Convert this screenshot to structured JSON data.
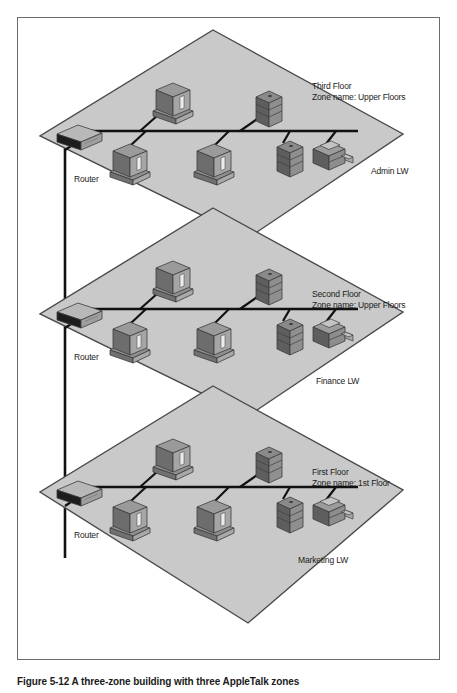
{
  "figure": {
    "caption": "Figure 5-12  A three-zone  building with three AppleTalk zones",
    "colors": {
      "floor_fill": "#c9c9c9",
      "floor_edge": "#4a4a4a",
      "cable": "#111111",
      "device_light": "#b3b3b3",
      "device_mid": "#8c8c8c",
      "device_dark": "#5a5a5a",
      "border": "#6b6b6b",
      "text": "#1a1a1a",
      "background": "#ffffff"
    }
  },
  "floors": [
    {
      "id": "third-floor",
      "title": "Third Floor",
      "zone": "Zone name: Upper Floors",
      "router_label": "Router",
      "printer_label": "Admin LW",
      "devices": [
        {
          "type": "computer",
          "name": "computer-upper"
        },
        {
          "type": "server",
          "name": "server-upper"
        },
        {
          "type": "computer",
          "name": "computer-lower-left"
        },
        {
          "type": "computer",
          "name": "computer-lower-center"
        },
        {
          "type": "server",
          "name": "server-lower"
        },
        {
          "type": "printer",
          "name": "printer"
        }
      ]
    },
    {
      "id": "second-floor",
      "title": "Second Floor",
      "zone": "Zone name: Upper Floors",
      "router_label": "Router",
      "printer_label": "Finance LW",
      "devices": [
        {
          "type": "computer",
          "name": "computer-upper"
        },
        {
          "type": "server",
          "name": "server-upper"
        },
        {
          "type": "computer",
          "name": "computer-lower-left"
        },
        {
          "type": "computer",
          "name": "computer-lower-center"
        },
        {
          "type": "server",
          "name": "server-lower"
        },
        {
          "type": "printer",
          "name": "printer"
        }
      ]
    },
    {
      "id": "first-floor",
      "title": "First Floor",
      "zone": "Zone name: 1st Floor",
      "router_label": "Router",
      "printer_label": "Marketing LW",
      "devices": [
        {
          "type": "computer",
          "name": "computer-upper"
        },
        {
          "type": "server",
          "name": "server-upper"
        },
        {
          "type": "computer",
          "name": "computer-lower-left"
        },
        {
          "type": "computer",
          "name": "computer-lower-center"
        },
        {
          "type": "server",
          "name": "server-lower"
        },
        {
          "type": "printer",
          "name": "printer"
        }
      ]
    }
  ],
  "backbone": {
    "name": "vertical-trunk-cable"
  }
}
